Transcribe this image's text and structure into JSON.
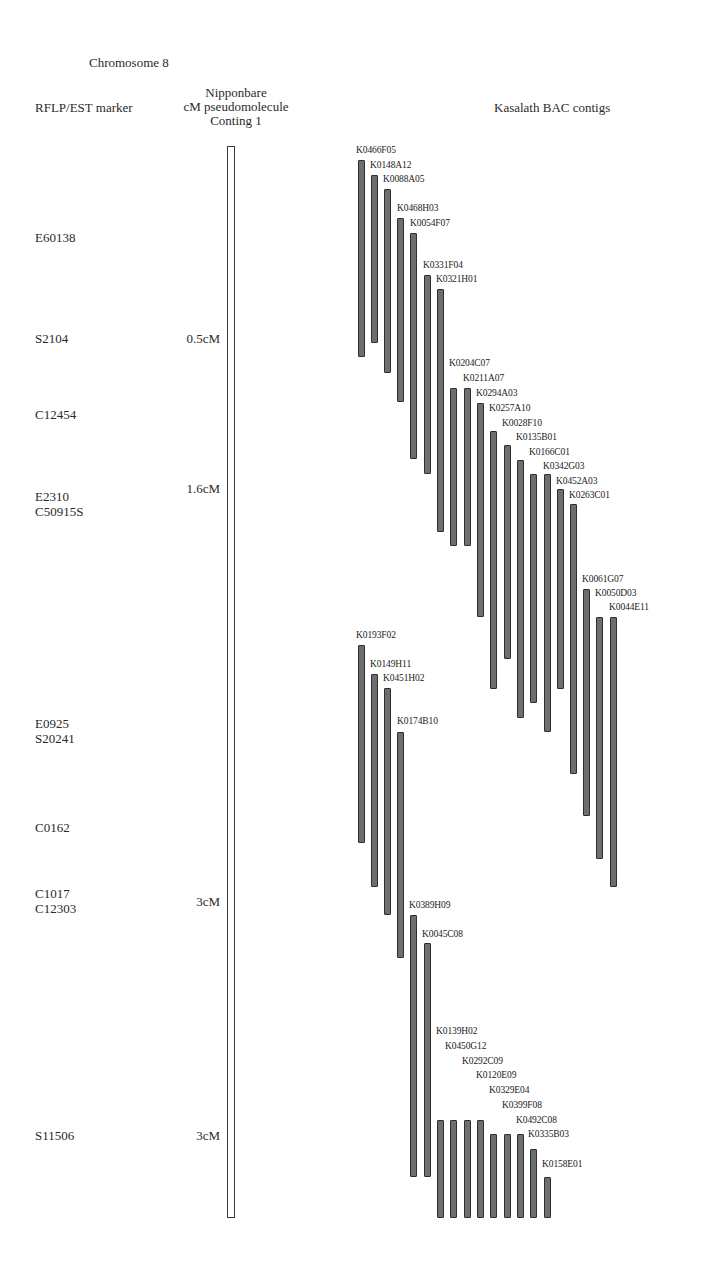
{
  "title": "Chromosome 8",
  "headers": {
    "marker_col": "RFLP/EST marker",
    "cm_col_line1": "Nipponbare",
    "cm_col_line2": "cM pseudomolecule",
    "cm_col_line3": "Conting 1",
    "contig_col": "Kasalath BAC contigs"
  },
  "markers": [
    {
      "lines": [
        "E60138"
      ],
      "y": 230
    },
    {
      "lines": [
        "S2104"
      ],
      "y": 331
    },
    {
      "lines": [
        "C12454"
      ],
      "y": 407
    },
    {
      "lines": [
        "E2310",
        "C50915S"
      ],
      "y": 489
    },
    {
      "lines": [
        "E0925",
        "S20241"
      ],
      "y": 716
    },
    {
      "lines": [
        "C0162"
      ],
      "y": 820
    },
    {
      "lines": [
        "C1017",
        "C12303"
      ],
      "y": 886
    },
    {
      "lines": [
        "S11506"
      ],
      "y": 1128
    }
  ],
  "cm_labels": [
    {
      "label": "0.5cM",
      "y": 331
    },
    {
      "label": "1.6cM",
      "y": 481
    },
    {
      "label": "3cM",
      "y": 894
    },
    {
      "label": "3cM",
      "y": 1128
    }
  ],
  "chromosome": {
    "x": 227,
    "top": 146,
    "bottom": 1218,
    "width": 8
  },
  "colors": {
    "bac_fill": "#6e6e6e",
    "bac_border": "#2e2e2e",
    "chromosome_border": "#3a3a3a"
  },
  "chart_data": {
    "type": "diagram",
    "title": "Chromosome 8",
    "columns": [
      "RFLP/EST marker",
      "Nipponbare cM pseudomolecule Conting 1",
      "Kasalath BAC contigs"
    ],
    "bac_clones": [
      {
        "name": "K0466F05",
        "x": 361,
        "top": 160,
        "bottom": 357
      },
      {
        "name": "K0148A12",
        "x": 374,
        "top": 175,
        "bottom": 343
      },
      {
        "name": "K0088A05",
        "x": 387,
        "top": 189,
        "bottom": 373
      },
      {
        "name": "K0468H03",
        "x": 400,
        "top": 218,
        "bottom": 402
      },
      {
        "name": "K0054F07",
        "x": 413,
        "top": 233,
        "bottom": 459
      },
      {
        "name": "K0331F04",
        "x": 427,
        "top": 275,
        "bottom": 474
      },
      {
        "name": "K0321H01",
        "x": 440,
        "top": 289,
        "bottom": 532
      },
      {
        "name": "K0204C07",
        "x": 453,
        "top": 388,
        "bottom": 546
      },
      {
        "name": "K0211A07",
        "x": 467,
        "top": 388,
        "bottom": 546
      },
      {
        "name": "K0294A03",
        "x": 480,
        "top": 403,
        "bottom": 617
      },
      {
        "name": "K0257A10",
        "x": 493,
        "top": 431,
        "bottom": 689
      },
      {
        "name": "K0028F10",
        "x": 507,
        "top": 445,
        "bottom": 659
      },
      {
        "name": "K0135B01",
        "x": 520,
        "top": 460,
        "bottom": 718
      },
      {
        "name": "K0166C01",
        "x": 533,
        "top": 474,
        "bottom": 703
      },
      {
        "name": "K0342G03",
        "x": 547,
        "top": 474,
        "bottom": 732
      },
      {
        "name": "K0452A03",
        "x": 560,
        "top": 489,
        "bottom": 689
      },
      {
        "name": "K0263C01",
        "x": 573,
        "top": 504,
        "bottom": 774
      },
      {
        "name": "K0061G07",
        "x": 586,
        "top": 589,
        "bottom": 816
      },
      {
        "name": "K0050D03",
        "x": 599,
        "top": 617,
        "bottom": 859
      },
      {
        "name": "K0044E11",
        "x": 613,
        "top": 617,
        "bottom": 887
      },
      {
        "name": "K0193F02",
        "x": 361,
        "top": 645,
        "bottom": 843
      },
      {
        "name": "K0149H11",
        "x": 374,
        "top": 674,
        "bottom": 887
      },
      {
        "name": "K0451H02",
        "x": 387,
        "top": 688,
        "bottom": 915
      },
      {
        "name": "K0174B10",
        "x": 400,
        "top": 732,
        "bottom": 958
      },
      {
        "name": "K0389H09",
        "x": 413,
        "top": 915,
        "bottom": 1177
      },
      {
        "name": "K0045C08",
        "x": 427,
        "top": 943,
        "bottom": 1177
      },
      {
        "name": "K0139H02",
        "x": 440,
        "top": 1120,
        "bottom": 1218
      },
      {
        "name": "K0450G12",
        "x": 453,
        "top": 1120,
        "bottom": 1218
      },
      {
        "name": "K0292C09",
        "x": 467,
        "top": 1120,
        "bottom": 1218
      },
      {
        "name": "K0120E09",
        "x": 480,
        "top": 1120,
        "bottom": 1218
      },
      {
        "name": "K0329E04",
        "x": 493,
        "top": 1134,
        "bottom": 1218
      },
      {
        "name": "K0399F08",
        "x": 507,
        "top": 1134,
        "bottom": 1218
      },
      {
        "name": "K0492C08",
        "x": 520,
        "top": 1134,
        "bottom": 1218
      },
      {
        "name": "K0335B03",
        "x": 533,
        "top": 1149,
        "bottom": 1218
      },
      {
        "name": "K0158E01",
        "x": 547,
        "top": 1177,
        "bottom": 1218
      }
    ],
    "bac_labels": [
      {
        "name": "K0466F05",
        "x": 356,
        "y": 145
      },
      {
        "name": "K0148A12",
        "x": 370,
        "y": 160
      },
      {
        "name": "K0088A05",
        "x": 383,
        "y": 174
      },
      {
        "name": "K0468H03",
        "x": 397,
        "y": 203
      },
      {
        "name": "K0054F07",
        "x": 410,
        "y": 218
      },
      {
        "name": "K0331F04",
        "x": 423,
        "y": 260
      },
      {
        "name": "K0321H01",
        "x": 436,
        "y": 274
      },
      {
        "name": "K0204C07",
        "x": 449,
        "y": 358
      },
      {
        "name": "K0211A07",
        "x": 463,
        "y": 373
      },
      {
        "name": "K0294A03",
        "x": 476,
        "y": 388
      },
      {
        "name": "K0257A10",
        "x": 489,
        "y": 403
      },
      {
        "name": "K0028F10",
        "x": 502,
        "y": 418
      },
      {
        "name": "K0135B01",
        "x": 516,
        "y": 432
      },
      {
        "name": "K0166C01",
        "x": 529,
        "y": 447
      },
      {
        "name": "K0342G03",
        "x": 543,
        "y": 461
      },
      {
        "name": "K0452A03",
        "x": 556,
        "y": 476
      },
      {
        "name": "K0263C01",
        "x": 569,
        "y": 490
      },
      {
        "name": "K0061G07",
        "x": 582,
        "y": 574
      },
      {
        "name": "K0050D03",
        "x": 595,
        "y": 588
      },
      {
        "name": "K0044E11",
        "x": 609,
        "y": 602
      },
      {
        "name": "K0193F02",
        "x": 356,
        "y": 630
      },
      {
        "name": "K0149H11",
        "x": 370,
        "y": 659
      },
      {
        "name": "K0451H02",
        "x": 383,
        "y": 673
      },
      {
        "name": "K0174B10",
        "x": 397,
        "y": 716
      },
      {
        "name": "K0389H09",
        "x": 409,
        "y": 900
      },
      {
        "name": "K0045C08",
        "x": 422,
        "y": 929
      },
      {
        "name": "K0139H02",
        "x": 436,
        "y": 1026
      },
      {
        "name": "K0450G12",
        "x": 445,
        "y": 1041
      },
      {
        "name": "K0292C09",
        "x": 462,
        "y": 1056
      },
      {
        "name": "K0120E09",
        "x": 476,
        "y": 1070
      },
      {
        "name": "K0329E04",
        "x": 489,
        "y": 1085
      },
      {
        "name": "K0399F08",
        "x": 502,
        "y": 1100
      },
      {
        "name": "K0492C08",
        "x": 516,
        "y": 1115
      },
      {
        "name": "K0335B03",
        "x": 528,
        "y": 1129
      },
      {
        "name": "K0158E01",
        "x": 542,
        "y": 1159
      }
    ]
  }
}
